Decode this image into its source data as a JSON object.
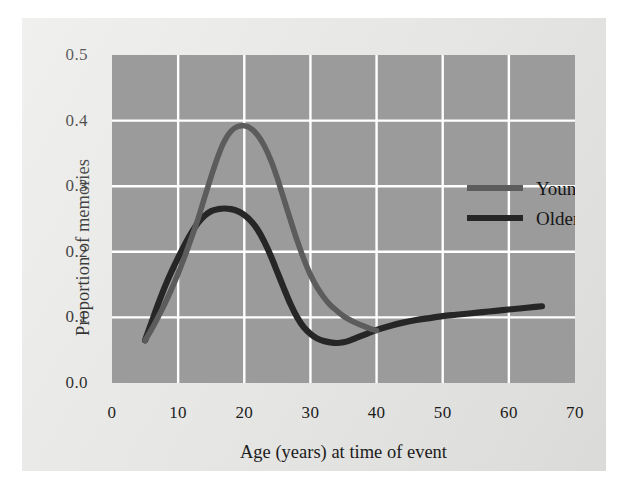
{
  "chart_data": {
    "type": "line",
    "title": "",
    "xlabel": "Age (years) at time of event",
    "ylabel": "Proportion of memories",
    "xlim": [
      0,
      70
    ],
    "ylim": [
      0.0,
      0.5
    ],
    "xticks": [
      "0",
      "10",
      "20",
      "30",
      "40",
      "50",
      "60",
      "70"
    ],
    "xtick_values": [
      0,
      10,
      20,
      30,
      40,
      50,
      60,
      70
    ],
    "yticks": [
      "0.0",
      "0.1",
      "0.2",
      "0.3",
      "0.4",
      "0.5"
    ],
    "ytick_values": [
      0.0,
      0.1,
      0.2,
      0.3,
      0.4,
      0.5
    ],
    "grid": true,
    "grid_color": "#ffffff",
    "plot_background": "#9b9b9b",
    "figure_background": "#e8e8e6",
    "legend_position": "upper right",
    "series": [
      {
        "name": "Young adults",
        "color": "#5c5c5c",
        "x": [
          5,
          6,
          7,
          8,
          9,
          10,
          11,
          12,
          13,
          14,
          15,
          16,
          17,
          18,
          19,
          20,
          21,
          22,
          23,
          24,
          25,
          26,
          27,
          28,
          29,
          30,
          31,
          32,
          33,
          34,
          35,
          36,
          37,
          38,
          39,
          40
        ],
        "values": [
          0.065,
          0.082,
          0.101,
          0.121,
          0.143,
          0.167,
          0.193,
          0.221,
          0.25,
          0.283,
          0.315,
          0.345,
          0.369,
          0.384,
          0.391,
          0.392,
          0.388,
          0.378,
          0.362,
          0.34,
          0.312,
          0.28,
          0.248,
          0.217,
          0.189,
          0.165,
          0.146,
          0.131,
          0.119,
          0.11,
          0.102,
          0.096,
          0.091,
          0.087,
          0.083,
          0.08
        ]
      },
      {
        "name": "Older adults",
        "color": "#262626",
        "x": [
          5,
          6,
          7,
          8,
          9,
          10,
          11,
          12,
          13,
          14,
          15,
          16,
          17,
          18,
          19,
          20,
          21,
          22,
          23,
          24,
          25,
          26,
          27,
          28,
          29,
          30,
          31,
          32,
          33,
          34,
          35,
          36,
          37,
          38,
          39,
          40,
          42,
          44,
          46,
          48,
          50,
          52,
          54,
          56,
          58,
          60,
          62,
          64,
          65
        ],
        "values": [
          0.065,
          0.093,
          0.121,
          0.147,
          0.17,
          0.191,
          0.211,
          0.229,
          0.244,
          0.255,
          0.262,
          0.265,
          0.266,
          0.265,
          0.262,
          0.256,
          0.247,
          0.234,
          0.216,
          0.194,
          0.169,
          0.144,
          0.12,
          0.1,
          0.085,
          0.075,
          0.068,
          0.064,
          0.062,
          0.061,
          0.062,
          0.065,
          0.069,
          0.073,
          0.077,
          0.081,
          0.087,
          0.092,
          0.096,
          0.099,
          0.102,
          0.104,
          0.106,
          0.108,
          0.11,
          0.112,
          0.114,
          0.116,
          0.117
        ]
      }
    ],
    "annotations": {
      "young_peak": {
        "age": 20,
        "value": 0.392
      },
      "older_peak": {
        "age": 17,
        "value": 0.266
      },
      "older_trough": {
        "age": 34,
        "value": 0.061
      },
      "crossover": {
        "age": 40,
        "value": 0.08
      }
    }
  },
  "legend": {
    "items": [
      {
        "label": "Young adults",
        "color": "#5c5c5c"
      },
      {
        "label": "Older adults",
        "color": "#262626"
      }
    ]
  }
}
